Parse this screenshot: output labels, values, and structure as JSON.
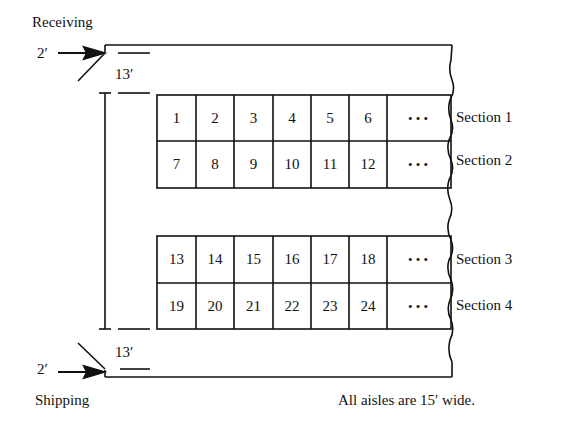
{
  "labels": {
    "receiving": "Receiving",
    "shipping": "Shipping",
    "door_width_top": "2′",
    "door_width_bottom": "2′",
    "clearance_top": "13′",
    "clearance_bottom": "13′",
    "note": "All aisles are 15′ wide."
  },
  "sections": [
    {
      "name": "Section 1",
      "bays": [
        "1",
        "2",
        "3",
        "4",
        "5",
        "6"
      ],
      "continuation": "• • •"
    },
    {
      "name": "Section 2",
      "bays": [
        "7",
        "8",
        "9",
        "10",
        "11",
        "12"
      ],
      "continuation": "• • •"
    },
    {
      "name": "Section 3",
      "bays": [
        "13",
        "14",
        "15",
        "16",
        "17",
        "18"
      ],
      "continuation": "• • •"
    },
    {
      "name": "Section 4",
      "bays": [
        "19",
        "20",
        "21",
        "22",
        "23",
        "24"
      ],
      "continuation": "• • •"
    }
  ]
}
